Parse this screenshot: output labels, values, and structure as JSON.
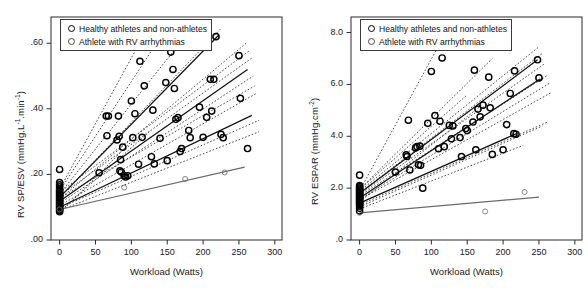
{
  "figure": {
    "type": "scatter-with-regression-lines",
    "panel_count": 2
  },
  "legend": {
    "entries": [
      {
        "label": "Healthy athletes and non-athletes",
        "marker": "bold-open-circle",
        "color": "#000000"
      },
      {
        "label": "Athlete with RV arrhythmias",
        "marker": "thin-open-circle",
        "color": "#555555"
      }
    ]
  },
  "panels": [
    {
      "id": "panel-left",
      "ylabel_main": "RV SP/ESV (mmHg.L",
      "ylabel_sup1": "-1",
      "ylabel_mid": ".min",
      "ylabel_sup2": "-1",
      "ylabel_end": ")",
      "ylabel_plain": "RV SP/ESV (mmHg.L-1.min-1)",
      "xlabel": "Workload (Watts)",
      "yticks": [
        ".00",
        ".20",
        ".40",
        ".60"
      ],
      "ytick_values": [
        0.0,
        0.2,
        0.4,
        0.6
      ],
      "xticks": [
        "0",
        "50",
        "100",
        "150",
        "200",
        "250",
        "300"
      ],
      "xtick_values": [
        0,
        50,
        100,
        150,
        200,
        250,
        300
      ]
    },
    {
      "id": "panel-right",
      "ylabel_main": "RV ESPAR (mmHg.cm",
      "ylabel_sup1": "-2",
      "ylabel_end": ")",
      "ylabel_plain": "RV ESPAR (mmHg.cm-2)",
      "xlabel": "Workload (Watts)",
      "yticks": [
        ".0",
        "2.0",
        "4.0",
        "6.0",
        "8.0"
      ],
      "ytick_values": [
        0.0,
        2.0,
        4.0,
        6.0,
        8.0
      ],
      "xticks": [
        "0",
        "50",
        "100",
        "150",
        "200",
        "250",
        "300"
      ],
      "xtick_values": [
        0,
        50,
        100,
        150,
        200,
        250,
        300
      ]
    }
  ],
  "chart_data": [
    {
      "type": "scatter",
      "id": "panel-left",
      "title": "",
      "xlabel": "Workload (Watts)",
      "ylabel": "RV SP/ESV (mmHg.L-1.min-1)",
      "xlim": [
        -12,
        310
      ],
      "ylim": [
        0.0,
        0.68
      ],
      "grid": false,
      "legend_position": "top-left-inside",
      "series": [
        {
          "name": "Healthy athletes and non-athletes",
          "marker": "bold-open-circle",
          "color": "#000000",
          "points": [
            [
              0,
              0.215
            ],
            [
              0,
              0.175
            ],
            [
              0,
              0.168
            ],
            [
              0,
              0.162
            ],
            [
              0,
              0.155
            ],
            [
              0,
              0.15
            ],
            [
              0,
              0.146
            ],
            [
              0,
              0.142
            ],
            [
              0,
              0.138
            ],
            [
              0,
              0.134
            ],
            [
              0,
              0.13
            ],
            [
              0,
              0.126
            ],
            [
              0,
              0.122
            ],
            [
              0,
              0.118
            ],
            [
              0,
              0.114
            ],
            [
              0,
              0.11
            ],
            [
              0,
              0.106
            ],
            [
              0,
              0.102
            ],
            [
              0,
              0.098
            ],
            [
              0,
              0.094
            ],
            [
              0,
              0.09
            ],
            [
              0,
              0.086
            ],
            [
              55,
              0.205
            ],
            [
              65,
              0.378
            ],
            [
              66,
              0.318
            ],
            [
              68,
              0.378
            ],
            [
              80,
              0.305
            ],
            [
              82,
              0.378
            ],
            [
              83,
              0.316
            ],
            [
              84,
              0.211
            ],
            [
              85,
              0.245
            ],
            [
              86,
              0.207
            ],
            [
              88,
              0.283
            ],
            [
              90,
              0.196
            ],
            [
              92,
              0.192
            ],
            [
              95,
              0.196
            ],
            [
              100,
              0.424
            ],
            [
              102,
              0.312
            ],
            [
              105,
              0.385
            ],
            [
              110,
              0.231
            ],
            [
              112,
              0.545
            ],
            [
              115,
              0.313
            ],
            [
              118,
              0.47
            ],
            [
              120,
              0.6
            ],
            [
              128,
              0.254
            ],
            [
              130,
              0.396
            ],
            [
              132,
              0.232
            ],
            [
              140,
              0.31
            ],
            [
              145,
              0.6
            ],
            [
              148,
              0.48
            ],
            [
              150,
              0.242
            ],
            [
              155,
              0.573
            ],
            [
              158,
              0.52
            ],
            [
              160,
              0.462
            ],
            [
              162,
              0.368
            ],
            [
              165,
              0.373
            ],
            [
              168,
              0.27
            ],
            [
              170,
              0.279
            ],
            [
              180,
              0.334
            ],
            [
              182,
              0.312
            ],
            [
              195,
              0.405
            ],
            [
              200,
              0.313
            ],
            [
              205,
              0.374
            ],
            [
              210,
              0.49
            ],
            [
              212,
              0.393
            ],
            [
              215,
              0.49
            ],
            [
              218,
              0.62
            ],
            [
              225,
              0.322
            ],
            [
              228,
              0.312
            ],
            [
              250,
              0.562
            ],
            [
              252,
              0.432
            ],
            [
              262,
              0.279
            ]
          ]
        },
        {
          "name": "Athlete with RV arrhythmias",
          "marker": "thin-open-circle",
          "color": "#555555",
          "points": [
            [
              0,
              0.093
            ],
            [
              90,
              0.16
            ],
            [
              175,
              0.186
            ],
            [
              230,
              0.206
            ]
          ]
        }
      ],
      "regression_lines": [
        {
          "style": "dotted",
          "x0": 0,
          "y0": 0.155,
          "x1": 125,
          "y1": 0.655,
          "subject": "s1"
        },
        {
          "style": "dotted",
          "x0": 0,
          "y0": 0.15,
          "x1": 150,
          "y1": 0.65,
          "subject": "s2"
        },
        {
          "style": "dotted",
          "x0": 0,
          "y0": 0.14,
          "x1": 185,
          "y1": 0.648,
          "subject": "s3"
        },
        {
          "style": "dotted",
          "x0": 0,
          "y0": 0.13,
          "x1": 225,
          "y1": 0.645,
          "subject": "s4"
        },
        {
          "style": "solid-thin",
          "x0": 0,
          "y0": 0.13,
          "x1": 222,
          "y1": 0.625,
          "subject": "s5"
        },
        {
          "style": "dotted",
          "x0": 0,
          "y0": 0.125,
          "x1": 260,
          "y1": 0.6,
          "subject": "s6"
        },
        {
          "style": "dotted",
          "x0": 0,
          "y0": 0.145,
          "x1": 265,
          "y1": 0.578,
          "subject": "s7"
        },
        {
          "style": "dotted",
          "x0": 0,
          "y0": 0.135,
          "x1": 268,
          "y1": 0.555,
          "subject": "s8"
        },
        {
          "style": "solid-thin",
          "x0": 0,
          "y0": 0.118,
          "x1": 262,
          "y1": 0.52,
          "subject": "s9"
        },
        {
          "style": "dotted",
          "x0": 0,
          "y0": 0.112,
          "x1": 270,
          "y1": 0.5,
          "subject": "s10"
        },
        {
          "style": "dotted",
          "x0": 0,
          "y0": 0.128,
          "x1": 272,
          "y1": 0.47,
          "subject": "s11"
        },
        {
          "style": "dotted",
          "x0": 0,
          "y0": 0.105,
          "x1": 275,
          "y1": 0.448,
          "subject": "s12"
        },
        {
          "style": "solid-thin",
          "x0": 0,
          "y0": 0.1,
          "x1": 268,
          "y1": 0.38,
          "subject": "s13"
        },
        {
          "style": "dotted",
          "x0": 0,
          "y0": 0.098,
          "x1": 278,
          "y1": 0.365,
          "subject": "s14"
        },
        {
          "style": "dotted",
          "x0": 0,
          "y0": 0.09,
          "x1": 278,
          "y1": 0.33,
          "subject": "s15"
        },
        {
          "style": "dotted",
          "x0": 0,
          "y0": 0.086,
          "x1": 125,
          "y1": 0.33,
          "subject": "s16"
        },
        {
          "style": "dotted",
          "x0": 0,
          "y0": 0.082,
          "x1": 100,
          "y1": 0.3,
          "subject": "s17"
        },
        {
          "style": "solid-gray",
          "x0": 0,
          "y0": 0.093,
          "x1": 258,
          "y1": 0.222,
          "subject": "arrhythmia-patient"
        }
      ]
    },
    {
      "type": "scatter",
      "id": "panel-right",
      "title": "",
      "xlabel": "Workload (Watts)",
      "ylabel": "RV ESPAR (mmHg.cm-2)",
      "xlim": [
        -12,
        310
      ],
      "ylim": [
        0.0,
        8.6
      ],
      "grid": false,
      "legend_position": "top-left-inside",
      "series": [
        {
          "name": "Healthy athletes and non-athletes",
          "marker": "bold-open-circle",
          "color": "#000000",
          "points": [
            [
              0,
              2.5
            ],
            [
              0,
              2.1
            ],
            [
              0,
              2.05
            ],
            [
              0,
              2.0
            ],
            [
              0,
              1.96
            ],
            [
              0,
              1.92
            ],
            [
              0,
              1.88
            ],
            [
              0,
              1.84
            ],
            [
              0,
              1.8
            ],
            [
              0,
              1.76
            ],
            [
              0,
              1.72
            ],
            [
              0,
              1.68
            ],
            [
              0,
              1.64
            ],
            [
              0,
              1.6
            ],
            [
              0,
              1.56
            ],
            [
              0,
              1.52
            ],
            [
              0,
              1.48
            ],
            [
              0,
              1.44
            ],
            [
              0,
              1.4
            ],
            [
              0,
              1.36
            ],
            [
              0,
              1.3
            ],
            [
              0,
              1.22
            ],
            [
              0,
              1.12
            ],
            [
              50,
              2.62
            ],
            [
              65,
              3.28
            ],
            [
              66,
              3.22
            ],
            [
              68,
              4.62
            ],
            [
              70,
              2.7
            ],
            [
              78,
              3.55
            ],
            [
              80,
              3.6
            ],
            [
              82,
              2.9
            ],
            [
              84,
              3.62
            ],
            [
              85,
              2.88
            ],
            [
              88,
              2.0
            ],
            [
              95,
              4.5
            ],
            [
              100,
              6.5
            ],
            [
              105,
              4.8
            ],
            [
              110,
              3.52
            ],
            [
              112,
              4.58
            ],
            [
              115,
              7.02
            ],
            [
              118,
              3.6
            ],
            [
              125,
              4.42
            ],
            [
              128,
              3.9
            ],
            [
              130,
              4.4
            ],
            [
              140,
              3.95
            ],
            [
              142,
              3.22
            ],
            [
              148,
              4.3
            ],
            [
              150,
              4.22
            ],
            [
              158,
              4.55
            ],
            [
              160,
              6.55
            ],
            [
              162,
              3.48
            ],
            [
              165,
              5.05
            ],
            [
              168,
              4.75
            ],
            [
              172,
              5.2
            ],
            [
              180,
              6.28
            ],
            [
              182,
              5.1
            ],
            [
              185,
              3.3
            ],
            [
              200,
              3.48
            ],
            [
              205,
              4.45
            ],
            [
              210,
              5.65
            ],
            [
              215,
              4.1
            ],
            [
              216,
              6.52
            ],
            [
              218,
              4.08
            ],
            [
              248,
              6.95
            ],
            [
              250,
              6.25
            ]
          ]
        },
        {
          "name": "Athlete with RV arrhythmias",
          "marker": "thin-open-circle",
          "color": "#555555",
          "points": [
            [
              0,
              1.05
            ],
            [
              175,
              1.1
            ],
            [
              230,
              1.85
            ]
          ]
        }
      ],
      "regression_lines": [
        {
          "style": "dotted",
          "x0": 0,
          "y0": 1.9,
          "x1": 128,
          "y1": 8.4,
          "subject": "s1"
        },
        {
          "style": "dotted",
          "x0": 0,
          "y0": 1.95,
          "x1": 185,
          "y1": 7.0,
          "subject": "s2"
        },
        {
          "style": "dotted",
          "x0": 0,
          "y0": 1.88,
          "x1": 250,
          "y1": 7.45,
          "subject": "s3"
        },
        {
          "style": "dotted",
          "x0": 0,
          "y0": 1.82,
          "x1": 255,
          "y1": 7.2,
          "subject": "s4"
        },
        {
          "style": "solid-thin",
          "x0": 0,
          "y0": 1.8,
          "x1": 248,
          "y1": 6.95,
          "subject": "s5"
        },
        {
          "style": "dotted",
          "x0": 0,
          "y0": 1.75,
          "x1": 258,
          "y1": 6.8,
          "subject": "s6"
        },
        {
          "style": "dotted",
          "x0": 0,
          "y0": 1.95,
          "x1": 150,
          "y1": 5.6,
          "subject": "s7"
        },
        {
          "style": "dotted",
          "x0": 0,
          "y0": 1.7,
          "x1": 262,
          "y1": 6.35,
          "subject": "s8"
        },
        {
          "style": "solid-thin",
          "x0": 0,
          "y0": 1.62,
          "x1": 252,
          "y1": 6.22,
          "subject": "s9"
        },
        {
          "style": "dotted",
          "x0": 0,
          "y0": 1.58,
          "x1": 265,
          "y1": 6.05,
          "subject": "s10"
        },
        {
          "style": "dotted",
          "x0": 0,
          "y0": 1.55,
          "x1": 268,
          "y1": 5.7,
          "subject": "s11"
        },
        {
          "style": "dotted",
          "x0": 0,
          "y0": 1.48,
          "x1": 170,
          "y1": 5.2,
          "subject": "s12"
        },
        {
          "style": "solid-thin",
          "x0": 0,
          "y0": 1.42,
          "x1": 220,
          "y1": 4.12,
          "subject": "s13"
        },
        {
          "style": "dotted",
          "x0": 0,
          "y0": 1.35,
          "x1": 262,
          "y1": 4.55,
          "subject": "s14"
        },
        {
          "style": "dotted",
          "x0": 0,
          "y0": 1.28,
          "x1": 255,
          "y1": 4.4,
          "subject": "s15"
        },
        {
          "style": "dotted",
          "x0": 0,
          "y0": 1.2,
          "x1": 228,
          "y1": 3.65,
          "subject": "s16"
        },
        {
          "style": "solid-gray",
          "x0": 0,
          "y0": 1.05,
          "x1": 250,
          "y1": 1.65,
          "subject": "arrhythmia-patient"
        }
      ]
    }
  ]
}
